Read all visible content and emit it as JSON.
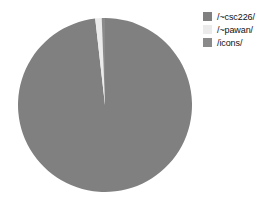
{
  "chart_data": {
    "type": "pie",
    "title": "",
    "subtitle": "",
    "xlabel": "",
    "ylabel": "",
    "grid": false,
    "legend_position": "right",
    "start_angle_deg": 0,
    "direction": "clockwise",
    "categories": [
      "/~csc226/",
      "/~pawan/",
      "/icons/"
    ],
    "values": [
      98.2,
      1.2,
      0.6
    ],
    "colors": [
      "#808080",
      "#ebebeb",
      "#8a8a8a"
    ],
    "slices": [
      {
        "label": "/~csc226/",
        "value": 98.2,
        "color": "#808080",
        "start_deg": 0.0,
        "end_deg": 353.5
      },
      {
        "label": "/~pawan/",
        "value": 1.2,
        "color": "#ebebeb",
        "start_deg": 353.5,
        "end_deg": 357.8
      },
      {
        "label": "/icons/",
        "value": 0.6,
        "color": "#8a8a8a",
        "start_deg": 357.8,
        "end_deg": 360.0
      }
    ]
  },
  "legend": {
    "items": [
      {
        "label": "/~csc226/",
        "color": "#808080",
        "swatch_name": "legend-swatch-csc226"
      },
      {
        "label": "/~pawan/",
        "color": "#ebebeb",
        "swatch_name": "legend-swatch-pawan"
      },
      {
        "label": "/icons/",
        "color": "#8a8a8a",
        "swatch_name": "legend-swatch-icons"
      }
    ]
  },
  "canvas": {
    "background": "#ffffff",
    "pie_center_x": 89,
    "pie_center_y": 89,
    "pie_radius": 87
  }
}
